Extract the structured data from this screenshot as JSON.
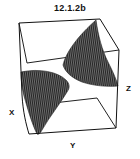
{
  "figure": {
    "title": "12.1.2b",
    "axes": {
      "x_label": "X",
      "y_label": "Y",
      "z_label": "Z"
    },
    "surface": {
      "description": "3D surface plot in a wireframe bounding box showing two hatched sheets of a surface (hyperbolic-like), one in the upper-right and one in the lower-left",
      "fill_color": "#4a4a4a",
      "hatch_color": "#1a1a1a",
      "edge_color": "#222222"
    }
  }
}
